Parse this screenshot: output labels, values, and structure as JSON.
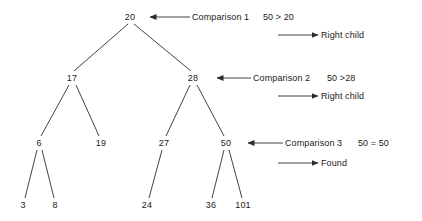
{
  "diagram": {
    "stroke_color": "#2b2b2b",
    "text_color": "#1a1a1a",
    "background": "#ffffff"
  },
  "tree": {
    "nodes": [
      {
        "id": "n20",
        "label": "20",
        "x": 130,
        "y": 17,
        "level": 0
      },
      {
        "id": "n17",
        "label": "17",
        "x": 72,
        "y": 78,
        "level": 1
      },
      {
        "id": "n28",
        "label": "28",
        "x": 193,
        "y": 78,
        "level": 1
      },
      {
        "id": "n6",
        "label": "6",
        "x": 39,
        "y": 143,
        "level": 2
      },
      {
        "id": "n19",
        "label": "19",
        "x": 101,
        "y": 143,
        "level": 2
      },
      {
        "id": "n27",
        "label": "27",
        "x": 164,
        "y": 143,
        "level": 2
      },
      {
        "id": "n50",
        "label": "50",
        "x": 226,
        "y": 143,
        "level": 2
      },
      {
        "id": "n3",
        "label": "3",
        "x": 23,
        "y": 205,
        "level": 3
      },
      {
        "id": "n8",
        "label": "8",
        "x": 55,
        "y": 205,
        "level": 3
      },
      {
        "id": "n24",
        "label": "24",
        "x": 147,
        "y": 205,
        "level": 3
      },
      {
        "id": "n36",
        "label": "36",
        "x": 211,
        "y": 205,
        "level": 3
      },
      {
        "id": "n101",
        "label": "101",
        "x": 243,
        "y": 205,
        "level": 3
      }
    ],
    "edges": [
      {
        "from": "n20",
        "to": "n17",
        "x1": 128,
        "y1": 24,
        "x2": 74,
        "y2": 71
      },
      {
        "from": "n20",
        "to": "n28",
        "x1": 134,
        "y1": 24,
        "x2": 191,
        "y2": 71
      },
      {
        "from": "n17",
        "to": "n6",
        "x1": 69,
        "y1": 85,
        "x2": 41,
        "y2": 136
      },
      {
        "from": "n17",
        "to": "n19",
        "x1": 76,
        "y1": 85,
        "x2": 99,
        "y2": 136
      },
      {
        "from": "n28",
        "to": "n27",
        "x1": 190,
        "y1": 85,
        "x2": 166,
        "y2": 136
      },
      {
        "from": "n28",
        "to": "n50",
        "x1": 197,
        "y1": 85,
        "x2": 224,
        "y2": 136
      },
      {
        "from": "n6",
        "to": "n3",
        "x1": 37,
        "y1": 150,
        "x2": 25,
        "y2": 198
      },
      {
        "from": "n6",
        "to": "n8",
        "x1": 42,
        "y1": 150,
        "x2": 54,
        "y2": 198
      },
      {
        "from": "n27",
        "to": "n24",
        "x1": 162,
        "y1": 150,
        "x2": 149,
        "y2": 198
      },
      {
        "from": "n50",
        "to": "n36",
        "x1": 224,
        "y1": 150,
        "x2": 212,
        "y2": 198
      },
      {
        "from": "n50",
        "to": "n101",
        "x1": 229,
        "y1": 150,
        "x2": 242,
        "y2": 198
      }
    ]
  },
  "annotations": [
    {
      "id": "comparison-1",
      "arrow": {
        "direction": "left",
        "x_start": 190,
        "x_end": 150,
        "y": 17
      },
      "label": "Comparison 1",
      "expression": "50 > 20",
      "label_x": 192,
      "expression_x": 263,
      "y": 17
    },
    {
      "id": "result-1",
      "arrow": {
        "direction": "right",
        "x_start": 278,
        "x_end": 318,
        "y": 35
      },
      "label": "Right child",
      "label_x": 321,
      "y": 35
    },
    {
      "id": "comparison-2",
      "arrow": {
        "direction": "left",
        "x_start": 251,
        "x_end": 217,
        "y": 78
      },
      "label": "Comparison 2",
      "expression": "50 >28",
      "label_x": 253,
      "expression_x": 327,
      "y": 78
    },
    {
      "id": "result-2",
      "arrow": {
        "direction": "right",
        "x_start": 278,
        "x_end": 318,
        "y": 96
      },
      "label": "Right child",
      "label_x": 321,
      "y": 96
    },
    {
      "id": "comparison-3",
      "arrow": {
        "direction": "left",
        "x_start": 283,
        "x_end": 248,
        "y": 143
      },
      "label": "Comparison 3",
      "expression": "50 = 50",
      "label_x": 285,
      "expression_x": 358,
      "y": 143
    },
    {
      "id": "result-3",
      "arrow": {
        "direction": "right",
        "x_start": 278,
        "x_end": 318,
        "y": 163
      },
      "label": "Found",
      "label_x": 321,
      "y": 163
    }
  ]
}
